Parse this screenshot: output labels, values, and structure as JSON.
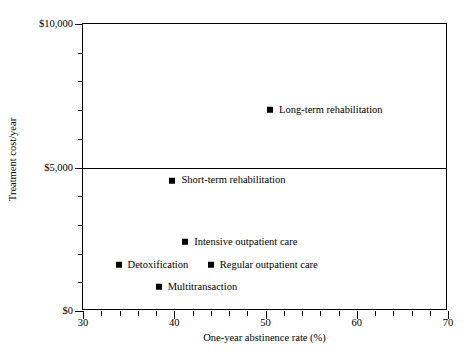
{
  "chart_data": {
    "type": "scatter",
    "title": "",
    "xlabel": "One-year abstinence rate (%)",
    "ylabel": "Treatment cost/year",
    "xlim": [
      30,
      70
    ],
    "ylim": [
      0,
      10000
    ],
    "grid": false,
    "legend": "none (direct point labels)",
    "x_ticks_major": [
      30,
      40,
      50,
      60,
      70
    ],
    "x_tick_labels": [
      "30",
      "40",
      "50",
      "60",
      "70"
    ],
    "x_ticks_minor": [
      32,
      34,
      36,
      38,
      42,
      44,
      46,
      48,
      52,
      54,
      56,
      58,
      62,
      64,
      66,
      68
    ],
    "y_ticks_major": [
      0,
      5000,
      10000
    ],
    "y_tick_labels": [
      "$0",
      "$5,000",
      "$10,000"
    ],
    "y_ticks_minor": [
      1000,
      2000,
      3000,
      4000,
      6000,
      7000,
      8000,
      9000
    ],
    "reference_lines": [
      5000
    ],
    "points": [
      {
        "label": "Long-term rehabilitation",
        "x": 50.5,
        "y": 7000
      },
      {
        "label": "Short-term rehabilitation",
        "x": 39.8,
        "y": 4550
      },
      {
        "label": "Intensive outpatient care",
        "x": 41.2,
        "y": 2400
      },
      {
        "label": "Detoxification",
        "x": 33.9,
        "y": 1620
      },
      {
        "label": "Regular outpatient care",
        "x": 44.0,
        "y": 1620
      },
      {
        "label": "Multitransaction",
        "x": 38.3,
        "y": 850
      }
    ]
  },
  "axes": {
    "x_title": "One-year abstinence rate (%)",
    "y_title": "Treatment cost/year"
  },
  "colors": {
    "marker": "#000000",
    "axis": "#000000",
    "background": "#ffffff"
  }
}
